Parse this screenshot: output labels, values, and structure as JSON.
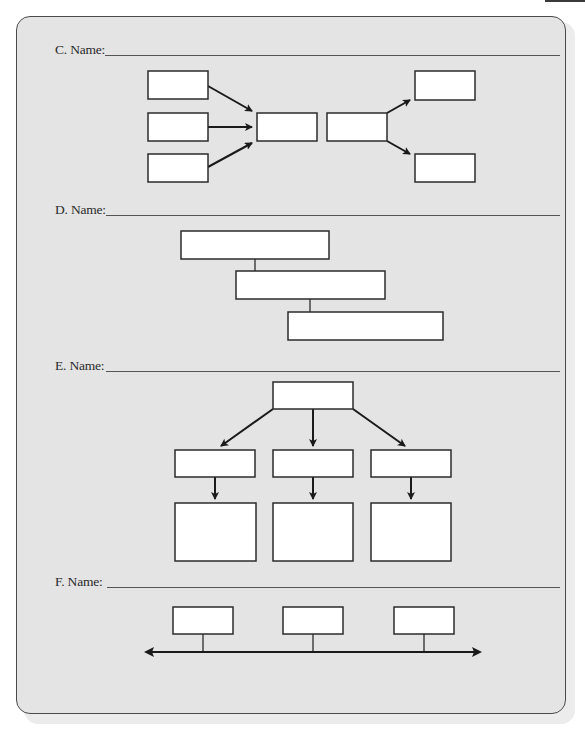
{
  "page": {
    "accent_colors": {
      "panel_fill": "#e4e4e4",
      "panel_border": "#4a4a4a",
      "box_fill": "#ffffff",
      "stroke": "#1a1a1a"
    }
  },
  "sections": [
    {
      "id": "C",
      "label": "C. Name:",
      "answer": "",
      "diagram_type": "converging-diverging flow (3 inputs → box, box → 2 outputs)"
    },
    {
      "id": "D",
      "label": "D. Name:",
      "answer": "",
      "diagram_type": "stepped cascade (3 offset boxes)"
    },
    {
      "id": "E",
      "label": "E. Name:",
      "answer": "",
      "diagram_type": "hierarchy tree (1 → 3 → 3)"
    },
    {
      "id": "F",
      "label": "F. Name:",
      "answer": "",
      "diagram_type": "timeline (3 boxes on double-headed arrow)"
    }
  ],
  "diagrams": {
    "C": {
      "boxes": [
        {
          "id": "c-in-1",
          "x": 148,
          "y": 71,
          "w": 60,
          "h": 28,
          "text": ""
        },
        {
          "id": "c-in-2",
          "x": 148,
          "y": 113,
          "w": 60,
          "h": 28,
          "text": ""
        },
        {
          "id": "c-in-3",
          "x": 148,
          "y": 154,
          "w": 60,
          "h": 28,
          "text": ""
        },
        {
          "id": "c-center-left",
          "x": 257,
          "y": 113,
          "w": 60,
          "h": 28,
          "text": ""
        },
        {
          "id": "c-center-right",
          "x": 327,
          "y": 113,
          "w": 60,
          "h": 28,
          "text": ""
        },
        {
          "id": "c-out-1",
          "x": 415,
          "y": 71,
          "w": 60,
          "h": 29,
          "text": ""
        },
        {
          "id": "c-out-2",
          "x": 415,
          "y": 154,
          "w": 60,
          "h": 28,
          "text": ""
        }
      ]
    },
    "D": {
      "boxes": [
        {
          "id": "d-step-1",
          "x": 181,
          "y": 231,
          "w": 148,
          "h": 28,
          "text": ""
        },
        {
          "id": "d-step-2",
          "x": 236,
          "y": 271,
          "w": 149,
          "h": 28,
          "text": ""
        },
        {
          "id": "d-step-3",
          "x": 288,
          "y": 312,
          "w": 155,
          "h": 28,
          "text": ""
        }
      ]
    },
    "E": {
      "boxes": [
        {
          "id": "e-root",
          "x": 273,
          "y": 382,
          "w": 80,
          "h": 27,
          "text": ""
        },
        {
          "id": "e-mid-1",
          "x": 175,
          "y": 450,
          "w": 80,
          "h": 27,
          "text": ""
        },
        {
          "id": "e-mid-2",
          "x": 273,
          "y": 450,
          "w": 80,
          "h": 27,
          "text": ""
        },
        {
          "id": "e-mid-3",
          "x": 371,
          "y": 450,
          "w": 80,
          "h": 27,
          "text": ""
        },
        {
          "id": "e-leaf-1",
          "x": 175,
          "y": 503,
          "w": 81,
          "h": 58,
          "text": ""
        },
        {
          "id": "e-leaf-2",
          "x": 273,
          "y": 503,
          "w": 80,
          "h": 58,
          "text": ""
        },
        {
          "id": "e-leaf-3",
          "x": 371,
          "y": 503,
          "w": 80,
          "h": 58,
          "text": ""
        }
      ]
    },
    "F": {
      "boxes": [
        {
          "id": "f-event-1",
          "x": 173,
          "y": 607,
          "w": 60,
          "h": 27,
          "text": ""
        },
        {
          "id": "f-event-2",
          "x": 283,
          "y": 607,
          "w": 60,
          "h": 27,
          "text": ""
        },
        {
          "id": "f-event-3",
          "x": 394,
          "y": 607,
          "w": 60,
          "h": 27,
          "text": ""
        }
      ]
    }
  }
}
